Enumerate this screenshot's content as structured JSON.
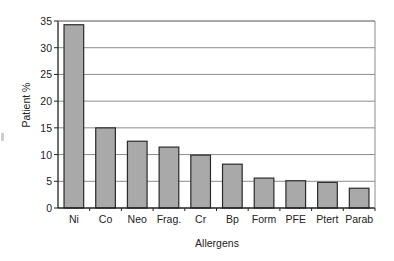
{
  "chart_data": {
    "type": "bar",
    "title": "",
    "xlabel": "Allergens",
    "ylabel": "Patient %",
    "categories": [
      "Ni",
      "Co",
      "Neo",
      "Frag.",
      "Cr",
      "Bp",
      "Form",
      "PFE",
      "Ptert",
      "Parab"
    ],
    "values": [
      34.3,
      15.0,
      12.5,
      11.4,
      9.9,
      8.2,
      5.6,
      5.1,
      4.8,
      3.7
    ],
    "ylim": [
      0,
      35
    ],
    "yticks": [
      0,
      5,
      10,
      15,
      20,
      25,
      30,
      35
    ],
    "grid": true,
    "legend": null,
    "colors": {
      "bar_fill": "#a9a9a9",
      "bar_edge": "#2a2a2a",
      "grid": "#8c8c8c",
      "axis": "#222222"
    }
  }
}
